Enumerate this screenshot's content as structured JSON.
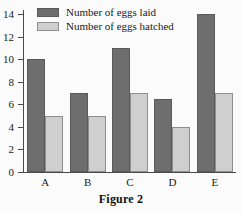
{
  "caption": "Figure 2",
  "legend": [
    {
      "key": "laid",
      "label": "Number of eggs laid",
      "color": "#6e6e6e"
    },
    {
      "key": "hatched",
      "label": "Number of eggs hatched",
      "color": "#cfcfcf"
    }
  ],
  "chart_data": {
    "type": "bar",
    "title": "",
    "subtitle": "",
    "xlabel": "",
    "ylabel": "",
    "categories": [
      "A",
      "B",
      "C",
      "D",
      "E"
    ],
    "ylim": [
      0,
      14
    ],
    "yticks": [
      0,
      2,
      4,
      6,
      8,
      10,
      12,
      14
    ],
    "ytick_labels": [
      "0",
      "2",
      "4",
      "6",
      "8",
      "10",
      "12",
      "14"
    ],
    "grid": false,
    "legend_position": "top-left",
    "series": [
      {
        "name": "Number of eggs laid",
        "color": "#6e6e6e",
        "values": [
          10,
          7,
          11,
          6.5,
          14
        ]
      },
      {
        "name": "Number of eggs hatched",
        "color": "#cfcfcf",
        "values": [
          5,
          5,
          7,
          4,
          7
        ]
      }
    ]
  }
}
